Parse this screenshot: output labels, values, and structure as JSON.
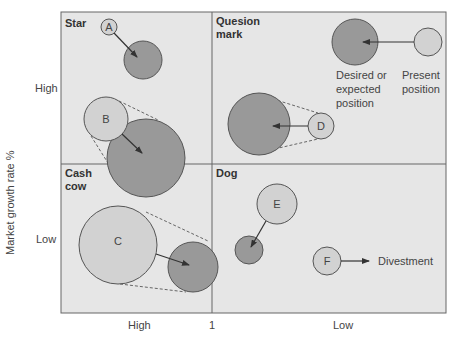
{
  "colors": {
    "background": "#ffffff",
    "frame_fill": "#e6e6e6",
    "frame_stroke": "#666666",
    "present_fill": "#d2d2d2",
    "desired_fill": "#999999",
    "circle_stroke": "#555555",
    "arrow": "#333333",
    "dashed": "#666666"
  },
  "axes": {
    "y_label": "Market growth rate %",
    "y_ticks": {
      "high": "High",
      "low": "Low"
    },
    "x_ticks": {
      "high": "High",
      "mid": "1",
      "low": "Low"
    }
  },
  "quadrants": {
    "star": "Star",
    "question_mark_line1": "Quesion",
    "question_mark_line2": "mark",
    "cash_cow_line1": "Cash",
    "cash_cow_line2": "cow",
    "dog": "Dog"
  },
  "legend": {
    "desired_line1": "Desired or",
    "desired_line2": "expected",
    "desired_line3": "position",
    "present_line1": "Present",
    "present_line2": "position"
  },
  "businesses": [
    {
      "label": "A",
      "quadrant": "Star"
    },
    {
      "label": "B",
      "quadrant": "Star"
    },
    {
      "label": "C",
      "quadrant": "Cash cow"
    },
    {
      "label": "D",
      "quadrant": "Question mark"
    },
    {
      "label": "E",
      "quadrant": "Dog"
    },
    {
      "label": "F",
      "quadrant": "Dog",
      "action": "Divestment"
    }
  ],
  "annotations": {
    "divestment": "Divestment"
  }
}
